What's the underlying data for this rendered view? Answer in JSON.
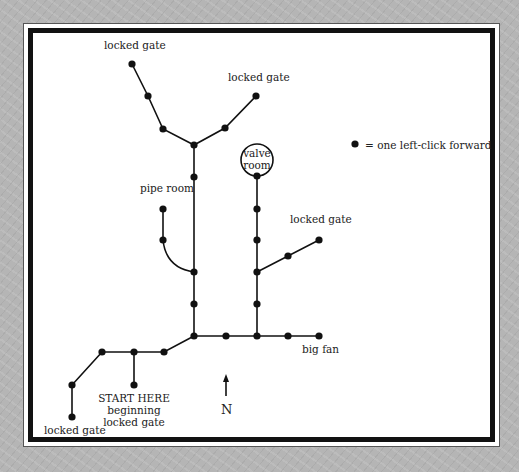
{
  "legend": {
    "symbol": "filled-dot",
    "text": "= one left-click forward"
  },
  "labels": {
    "locked_gate_top_left": "locked gate",
    "locked_gate_top_right": "locked gate",
    "valve_room_line1": "valve",
    "valve_room_line2": "room",
    "pipe_room": "pipe room",
    "locked_gate_mid_right": "locked gate",
    "big_fan": "big fan",
    "start_line1": "START HERE",
    "start_line2": "beginning",
    "start_line3": "locked gate",
    "locked_gate_bottom_left": "locked gate",
    "north": "N"
  },
  "colors": {
    "line": "#111111",
    "background": "#b5b5b5",
    "paper": "#ffffff"
  },
  "nodes": [
    [
      132,
      64
    ],
    [
      148,
      96
    ],
    [
      163,
      129
    ],
    [
      194,
      145
    ],
    [
      225,
      128
    ],
    [
      256,
      96
    ],
    [
      194,
      177
    ],
    [
      194,
      272
    ],
    [
      194,
      304
    ],
    [
      194,
      336
    ],
    [
      257,
      176
    ],
    [
      257,
      209
    ],
    [
      257,
      240
    ],
    [
      257,
      272
    ],
    [
      257,
      304
    ],
    [
      257,
      336
    ],
    [
      288,
      256
    ],
    [
      319,
      240
    ],
    [
      163,
      209
    ],
    [
      163,
      240
    ],
    [
      226,
      336
    ],
    [
      288,
      336
    ],
    [
      319,
      336
    ],
    [
      164,
      352
    ],
    [
      134,
      352
    ],
    [
      102,
      352
    ],
    [
      72,
      385
    ],
    [
      72,
      417
    ],
    [
      134,
      385
    ]
  ]
}
